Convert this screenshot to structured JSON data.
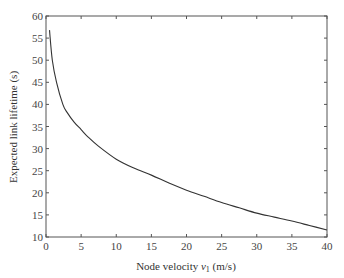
{
  "chart_data": {
    "type": "line",
    "title": "",
    "xlabel": "Node velocity v1 (m/s)",
    "xlabel_main": "Node velocity ",
    "xlabel_var": "v",
    "xlabel_sub": "1",
    "xlabel_unit": " (m/s)",
    "ylabel": "Expected link lifetime (s)",
    "xlim": [
      0,
      40
    ],
    "ylim": [
      10,
      60
    ],
    "xticks": [
      0,
      5,
      10,
      15,
      20,
      25,
      30,
      35,
      40
    ],
    "yticks": [
      10,
      15,
      20,
      25,
      30,
      35,
      40,
      45,
      50,
      55,
      60
    ],
    "grid": false,
    "legend": null,
    "series": [
      {
        "name": "Expected link lifetime",
        "color": "#333333",
        "x": [
          0.5,
          0.9,
          1.5,
          2.4,
          3,
          4,
          5,
          6,
          7.5,
          10,
          12.5,
          15,
          17.5,
          20,
          22.5,
          25,
          27.5,
          30,
          32.5,
          35,
          37.5,
          40
        ],
        "y": [
          56.8,
          50,
          45,
          40,
          38.2,
          36,
          34.3,
          32.6,
          30.5,
          27.6,
          25.6,
          24,
          22.2,
          20.6,
          19.2,
          17.8,
          16.6,
          15.4,
          14.5,
          13.6,
          12.6,
          11.6
        ]
      }
    ]
  }
}
